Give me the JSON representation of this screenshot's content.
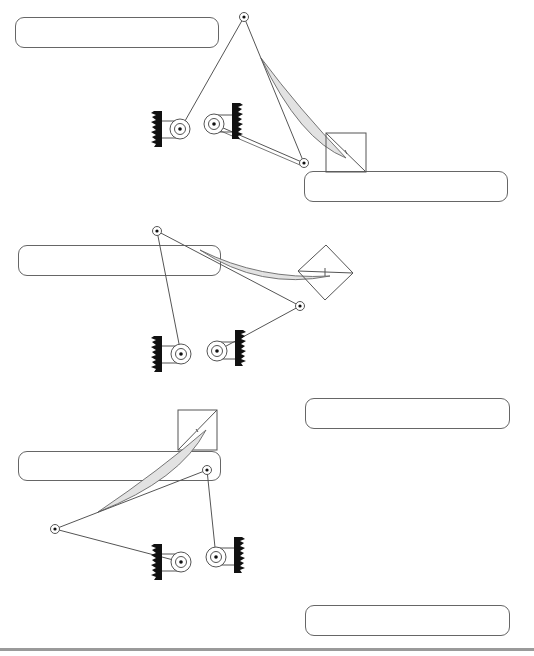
{
  "diagram": {
    "colors": {
      "line": "#555555",
      "fill_blade": "#e2e2e2",
      "wall": "#111111",
      "box_border": "#666666",
      "rule": "#9a9a9a"
    },
    "answer_boxes": [
      {
        "id": "box-1",
        "x": 15,
        "y": 17,
        "w": 204,
        "h": 31,
        "text": ""
      },
      {
        "id": "box-2",
        "x": 304,
        "y": 171,
        "w": 204,
        "h": 31,
        "text": ""
      },
      {
        "id": "box-3",
        "x": 18,
        "y": 245,
        "w": 203,
        "h": 31,
        "text": ""
      },
      {
        "id": "box-4",
        "x": 305,
        "y": 398,
        "w": 205,
        "h": 31,
        "text": ""
      },
      {
        "id": "box-5",
        "x": 18,
        "y": 451,
        "w": 203,
        "h": 30,
        "text": ""
      },
      {
        "id": "box-6",
        "x": 305,
        "y": 605,
        "w": 205,
        "h": 31,
        "text": ""
      }
    ],
    "figures": [
      {
        "id": "figure-1",
        "pivot": [
          244,
          17
        ],
        "joint": [
          304,
          163
        ],
        "pulleys": [
          [
            180,
            129
          ],
          [
            214,
            124
          ]
        ],
        "square": "upright"
      },
      {
        "id": "figure-2",
        "pivot": [
          157,
          231
        ],
        "joint": [
          300,
          306
        ],
        "pulleys": [
          [
            181,
            354
          ],
          [
            217,
            351
          ]
        ],
        "square": "diamond"
      },
      {
        "id": "figure-3",
        "pivot": [
          55,
          529
        ],
        "joint": [
          207,
          470
        ],
        "pulleys": [
          [
            181,
            562
          ],
          [
            216,
            557
          ]
        ],
        "square": "upright"
      }
    ]
  }
}
